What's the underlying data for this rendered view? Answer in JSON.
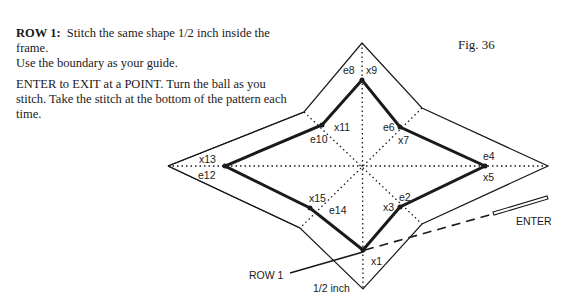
{
  "instructions": {
    "row_label": "ROW 1:",
    "line1": "Stitch the same shape 1/2 inch inside the frame.",
    "line2": "Use the boundary as your guide.",
    "line3": "ENTER to EXIT at a POINT. Turn the ball as you stitch. Take the stitch at the bottom of the pattern each time."
  },
  "figure": {
    "label": "Fig. 36",
    "points": {
      "x1": "x1",
      "e2": "e2",
      "x3": "x3",
      "e4": "e4",
      "x5": "x5",
      "e6": "e6",
      "x7": "x7",
      "e8": "e8",
      "x9": "x9",
      "e10": "e10",
      "x11": "x11",
      "e12": "e12",
      "x13": "x13",
      "e14": "e14",
      "x15": "x15"
    },
    "callouts": {
      "row1": "ROW 1",
      "enter": "ENTER",
      "half_inch": "1/2 inch"
    },
    "colors": {
      "line": "#1a1a1a",
      "background": "#ffffff"
    }
  }
}
